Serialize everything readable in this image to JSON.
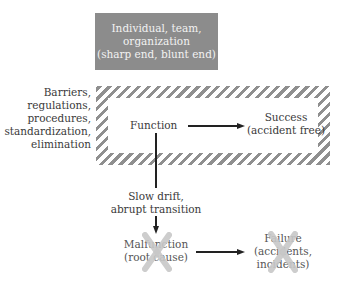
{
  "top_box": {
    "lines": [
      "Individual, team,",
      "organization",
      "(sharp end, blunt end)"
    ],
    "color": "#8c8c8c"
  },
  "side_label": {
    "lines": [
      "Barriers,",
      "regulations,",
      "procedures,",
      "standardization,",
      "elimination"
    ]
  },
  "function_node": {
    "label": "Function"
  },
  "success_node": {
    "lines": [
      "Success",
      "(accident free)"
    ]
  },
  "transition_label": {
    "lines": [
      "Slow drift,",
      "abrupt transition"
    ]
  },
  "malfunction_node": {
    "lines": [
      "Malfunction",
      "(root cause)"
    ],
    "crossed_out": true
  },
  "failure_node": {
    "lines": [
      "Failure",
      "(accidents,",
      "incidents)"
    ],
    "crossed_out": true
  },
  "colors": {
    "hatch": "#8f8f8f",
    "cross": "#c8c8c8",
    "arrow": "#222222"
  }
}
